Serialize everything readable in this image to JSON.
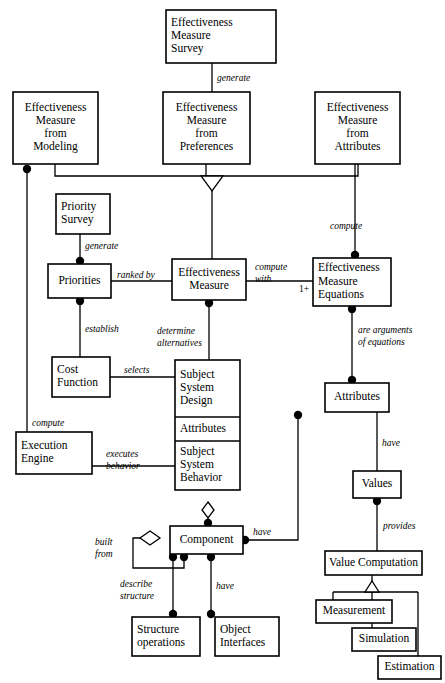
{
  "diagram": {
    "type": "uml-class-diagram",
    "width": 445,
    "height": 683,
    "background_color": "#ffffff",
    "line_color": "#000000",
    "text_color": "#000000"
  },
  "nodes": [
    {
      "id": "ems",
      "name": "effectiveness-measure-survey",
      "lines": [
        "Effectiveness",
        "Measure",
        "Survey"
      ],
      "x": 166,
      "y": 10,
      "w": 110,
      "h": 53,
      "align": "left"
    },
    {
      "id": "emfm",
      "name": "effectiveness-measure-from-modeling",
      "lines": [
        "Effectiveness",
        "Measure",
        "from",
        "Modeling"
      ],
      "x": 13,
      "y": 92,
      "w": 85,
      "h": 72,
      "align": "center"
    },
    {
      "id": "emfp",
      "name": "effectiveness-measure-from-preferences",
      "lines": [
        "Effectiveness",
        "Measure",
        "from",
        "Preferences"
      ],
      "x": 163,
      "y": 92,
      "w": 87,
      "h": 72,
      "align": "center"
    },
    {
      "id": "emfa",
      "name": "effectiveness-measure-from-attributes",
      "lines": [
        "Effectiveness",
        "Measure",
        "from",
        "Attributes"
      ],
      "x": 315,
      "y": 92,
      "w": 85,
      "h": 72,
      "align": "center"
    },
    {
      "id": "psurv",
      "name": "priority-survey",
      "lines": [
        "Priority",
        "Survey"
      ],
      "x": 56,
      "y": 194,
      "w": 54,
      "h": 40,
      "align": "left"
    },
    {
      "id": "prio",
      "name": "priorities",
      "lines": [
        "Priorities"
      ],
      "x": 48,
      "y": 264,
      "w": 63,
      "h": 34,
      "align": "center"
    },
    {
      "id": "em",
      "name": "effectiveness-measure",
      "lines": [
        "Effectiveness",
        "Measure"
      ],
      "x": 172,
      "y": 259,
      "w": 74,
      "h": 41,
      "align": "center"
    },
    {
      "id": "eme",
      "name": "effectiveness-measure-equations",
      "lines": [
        "Effectiveness",
        "Measure",
        "Equations"
      ],
      "x": 313,
      "y": 258,
      "w": 78,
      "h": 48,
      "align": "left"
    },
    {
      "id": "cost",
      "name": "cost-function",
      "lines": [
        "Cost",
        "Function"
      ],
      "x": 52,
      "y": 357,
      "w": 58,
      "h": 40,
      "align": "left"
    },
    {
      "id": "exec",
      "name": "execution-engine",
      "lines": [
        "Execution",
        "Engine"
      ],
      "x": 16,
      "y": 432,
      "w": 76,
      "h": 42,
      "align": "left"
    },
    {
      "id": "attrs",
      "name": "attributes",
      "lines": [
        "Attributes"
      ],
      "x": 325,
      "y": 383,
      "w": 64,
      "h": 29,
      "align": "center"
    },
    {
      "id": "values",
      "name": "values",
      "lines": [
        "Values"
      ],
      "x": 353,
      "y": 471,
      "w": 48,
      "h": 27,
      "align": "center"
    },
    {
      "id": "comp",
      "name": "component",
      "lines": [
        "Component"
      ],
      "x": 170,
      "y": 526,
      "w": 73,
      "h": 28,
      "align": "center"
    },
    {
      "id": "vcomp",
      "name": "value-computation",
      "lines": [
        "Value Computation"
      ],
      "x": 325,
      "y": 551,
      "w": 97,
      "h": 24,
      "align": "center"
    },
    {
      "id": "struct",
      "name": "structure-operations",
      "lines": [
        "Structure",
        "operations"
      ],
      "x": 132,
      "y": 617,
      "w": 68,
      "h": 39,
      "align": "left"
    },
    {
      "id": "objint",
      "name": "object-interfaces",
      "lines": [
        "Object",
        "Interfaces"
      ],
      "x": 215,
      "y": 617,
      "w": 64,
      "h": 39,
      "align": "left"
    },
    {
      "id": "meas",
      "name": "measurement",
      "lines": [
        "Measurement"
      ],
      "x": 316,
      "y": 600,
      "w": 76,
      "h": 23,
      "align": "center"
    },
    {
      "id": "sim",
      "name": "simulation",
      "lines": [
        "Simulation"
      ],
      "x": 352,
      "y": 628,
      "w": 64,
      "h": 23,
      "align": "center"
    },
    {
      "id": "est",
      "name": "estimation",
      "lines": [
        "Estimation"
      ],
      "x": 378,
      "y": 656,
      "w": 63,
      "h": 23,
      "align": "center"
    }
  ],
  "compartment_node": {
    "id": "sysdesign",
    "name": "subject-system-design",
    "x": 175,
    "y": 360,
    "w": 65,
    "compartments": [
      {
        "name": "subject-system-design-section",
        "lines": [
          "Subject",
          "System",
          "Design"
        ],
        "h": 57,
        "align": "left"
      },
      {
        "name": "attributes-section",
        "lines": [
          "Attributes"
        ],
        "h": 24,
        "align": "left"
      },
      {
        "name": "subject-system-behavior-section",
        "lines": [
          "Subject",
          "System",
          "Behavior"
        ],
        "h": 49,
        "align": "left"
      }
    ]
  },
  "edges": [
    {
      "name": "edge-survey-generates-preferences",
      "path": "M 212 63 L 212 92",
      "dots": [],
      "label": "generate",
      "lx": 217,
      "ly": 79
    },
    {
      "name": "edge-modeling-to-bus",
      "path": "M 55 164 L 55 176 L 206 176",
      "dots": [],
      "label": "",
      "lx": 0,
      "ly": 0
    },
    {
      "name": "edge-attributes-to-bus",
      "path": "M 358 164 L 358 176 L 218 176",
      "dots": [],
      "label": "",
      "lx": 0,
      "ly": 0
    },
    {
      "name": "edge-preferences-to-triangle",
      "path": "M 206 164 L 206 176 L 218 176",
      "dots": [],
      "label": "",
      "lx": 0,
      "ly": 0
    },
    {
      "name": "edge-generalization-stem",
      "path": "M 212 190 L 212 259",
      "dots": [],
      "label": "",
      "lx": 0,
      "ly": 0
    },
    {
      "name": "edge-modeling-computes-execution",
      "path": "M 27 172 L 27 453",
      "dots": [
        {
          "x": 27,
          "y": 169
        }
      ],
      "label": "compute",
      "lx": 32,
      "ly": 424
    },
    {
      "name": "edge-survey-generates-priorities",
      "path": "M 80 234 L 80 264",
      "dots": [
        {
          "x": 80,
          "y": 261
        }
      ],
      "label": "generate",
      "lx": 85,
      "ly": 247
    },
    {
      "name": "edge-priorities-ranked-by-em",
      "path": "M 111 281 L 172 281",
      "dots": [],
      "label": "ranked by",
      "lx": 117,
      "ly": 276
    },
    {
      "name": "edge-priorities-establish-cost",
      "path": "M 80 298 L 80 357",
      "dots": [
        {
          "x": 80,
          "y": 301
        }
      ],
      "label": "establish",
      "lx": 85,
      "ly": 330
    },
    {
      "name": "edge-em-compute-with-equations",
      "path": "M 246 281 L 313 281",
      "dots": [],
      "label": "compute with",
      "lx": 255,
      "ly": 268
    },
    {
      "name": "edge-attributes-compute-equations",
      "path": "M 355 164 L 355 258",
      "dots": [
        {
          "x": 355,
          "y": 255
        }
      ],
      "label": "compute",
      "lx": 330,
      "ly": 227
    },
    {
      "name": "edge-em-determine-alternatives",
      "path": "M 209 300 L 209 360",
      "dots": [
        {
          "x": 209,
          "y": 303
        }
      ],
      "label": "determine alternatives",
      "lx": 157,
      "ly": 332
    },
    {
      "name": "edge-cost-selects-design",
      "path": "M 110 377 L 175 377",
      "dots": [],
      "label": "selects",
      "lx": 124,
      "ly": 371
    },
    {
      "name": "edge-execution-executes-behavior",
      "path": "M 92 466 L 175 466",
      "dots": [],
      "label": "executes behavior",
      "lx": 106,
      "ly": 455
    },
    {
      "name": "edge-equations-arguments-attributes",
      "path": "M 352 306 L 352 383",
      "dots": [
        {
          "x": 352,
          "y": 309
        },
        {
          "x": 352,
          "y": 380
        }
      ],
      "label": "are arguments of equations",
      "lx": 358,
      "ly": 331
    },
    {
      "name": "edge-attributes-have-values",
      "path": "M 377 412 L 377 471",
      "dots": [],
      "label": "have",
      "lx": 382,
      "ly": 444
    },
    {
      "name": "edge-values-provides-vcomp",
      "path": "M 377 498 L 377 551",
      "dots": [
        {
          "x": 377,
          "y": 501
        }
      ],
      "label": "provides",
      "lx": 383,
      "ly": 527
    },
    {
      "name": "edge-behavior-aggregates-component",
      "path": "M 208 509 L 208 526",
      "dots": [
        {
          "x": 208,
          "y": 523
        }
      ],
      "label": "",
      "lx": 0,
      "ly": 0
    },
    {
      "name": "edge-component-have-attributes",
      "path": "M 243 540 L 298 540 L 298 412",
      "dots": [
        {
          "x": 245,
          "y": 540
        },
        {
          "x": 298,
          "y": 415
        }
      ],
      "label": "have",
      "lx": 253,
      "ly": 533
    },
    {
      "name": "edge-component-built-from-self",
      "path": "M 150 538 L 133 538 L 133 568 L 184 568 L 184 554",
      "dots": [
        {
          "x": 184,
          "y": 557
        }
      ],
      "label": "built from",
      "lx": 95,
      "ly": 543
    },
    {
      "name": "edge-component-describe-structure",
      "path": "M 173 554 L 173 617",
      "dots": [
        {
          "x": 173,
          "y": 557
        },
        {
          "x": 173,
          "y": 614
        }
      ],
      "label": "describe structure",
      "lx": 120,
      "ly": 585
    },
    {
      "name": "edge-component-have-objint",
      "path": "M 211 554 L 211 617",
      "dots": [
        {
          "x": 211,
          "y": 557
        },
        {
          "x": 211,
          "y": 614
        }
      ],
      "label": "have",
      "lx": 216,
      "ly": 587
    },
    {
      "name": "edge-vcomp-generalization-stem",
      "path": "M 372 575 L 372 582",
      "dots": [],
      "label": "",
      "lx": 0,
      "ly": 0
    },
    {
      "name": "edge-generalization-bus-vcomp",
      "path": "M 333 592 L 418 592",
      "dots": [],
      "label": "",
      "lx": 0,
      "ly": 0
    },
    {
      "name": "edge-measurement-to-bus",
      "path": "M 333 592 L 333 600",
      "dots": [],
      "label": "",
      "lx": 0,
      "ly": 0
    },
    {
      "name": "edge-simulation-to-bus",
      "path": "M 372 592 L 372 628",
      "dots": [],
      "label": "",
      "lx": 0,
      "ly": 0
    },
    {
      "name": "edge-estimation-to-bus",
      "path": "M 418 592 L 418 656",
      "dots": [],
      "label": "",
      "lx": 0,
      "ly": 0
    }
  ],
  "markers": {
    "generalization_top": {
      "name": "generalization-triangle-effectiveness-measure",
      "points": "201,176 223,176 212,191"
    },
    "generalization_bottom": {
      "name": "generalization-triangle-value-computation",
      "points": "365,592 379,592 372,581"
    },
    "aggregation_behavior": {
      "name": "aggregation-diamond-subject-system-behavior",
      "points": "208,502 214,510 208,518 202,510"
    },
    "aggregation_component_self": {
      "name": "aggregation-diamond-component-built-from",
      "points": "150,531 160,538 150,545 140,538"
    }
  },
  "multiplicities": [
    {
      "name": "multiplicity-equations",
      "text": "1+",
      "x": 299,
      "y": 290
    }
  ]
}
